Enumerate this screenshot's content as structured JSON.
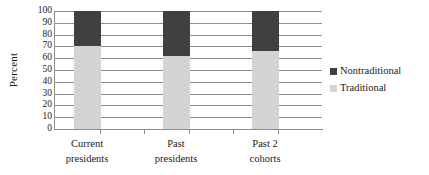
{
  "chart_data": {
    "type": "bar",
    "subtype": "stacked-percent-column",
    "title": "",
    "xlabel": "",
    "ylabel": "Percent",
    "ylim": [
      0,
      100
    ],
    "ytick_step": 10,
    "yticks": [
      100,
      90,
      80,
      70,
      60,
      50,
      40,
      30,
      20,
      10,
      0
    ],
    "ytick_labels": [
      "100",
      "90",
      "80",
      "70",
      "60",
      "50",
      "40",
      "30",
      "20",
      "10",
      "0"
    ],
    "grid": true,
    "grid_axis": "y",
    "legend_position": "right",
    "categories": [
      "Current presidents",
      "Past presidents",
      "Past 2 cohorts"
    ],
    "category_lines": [
      [
        "Current",
        "presidents"
      ],
      [
        "Past",
        "presidents"
      ],
      [
        "Past 2",
        "cohorts"
      ]
    ],
    "series": [
      {
        "name": "Traditional",
        "color": "#d4d4d4",
        "values": [
          70,
          62,
          66
        ]
      },
      {
        "name": "Nontraditional",
        "color": "#404040",
        "values": [
          30,
          38,
          34
        ]
      }
    ],
    "legend_order": [
      "Nontraditional",
      "Traditional"
    ]
  },
  "legend": {
    "items": [
      {
        "label": "Nontraditional",
        "color": "#404040"
      },
      {
        "label": "Traditional",
        "color": "#d4d4d4"
      }
    ]
  },
  "axis": {
    "y_title": "Percent"
  }
}
